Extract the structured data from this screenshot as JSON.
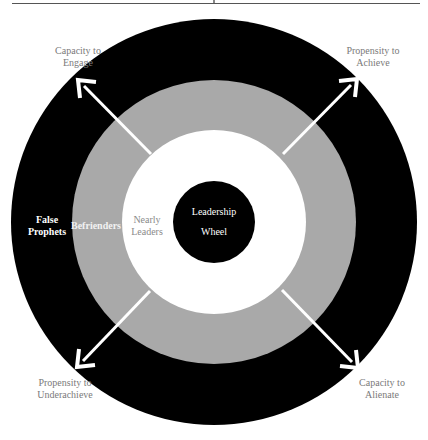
{
  "diagram": {
    "title": "Leadership Wheel",
    "center": {
      "line1": "Leadership",
      "line2": "Wheel"
    },
    "rings": [
      {
        "name": "center",
        "color": "#000000"
      },
      {
        "name": "nearly-leaders",
        "label_line1": "Nearly",
        "label_line2": "Leaders",
        "color": "#ffffff"
      },
      {
        "name": "befrienders",
        "label": "Befrienders",
        "color": "#a9a9a9"
      },
      {
        "name": "false-prophets",
        "label_line1": "False",
        "label_line2": "Prophets",
        "color": "#000000"
      }
    ],
    "arrows": [
      {
        "direction": "upper-left",
        "label_line1": "Capacity to",
        "label_line2": "Engage"
      },
      {
        "direction": "upper-right",
        "label_line1": "Propensity to",
        "label_line2": "Achieve"
      },
      {
        "direction": "lower-left",
        "label_line1": "Propensity to",
        "label_line2": "Underachieve"
      },
      {
        "direction": "lower-right",
        "label_line1": "Capacity to",
        "label_line2": "Alienate"
      }
    ],
    "colors": {
      "outer_ring": "#000000",
      "middle_ring": "#a9a9a9",
      "inner_ring": "#ffffff",
      "core": "#000000",
      "arrow": "#ffffff",
      "axis_label": "#7a7a7a"
    }
  }
}
